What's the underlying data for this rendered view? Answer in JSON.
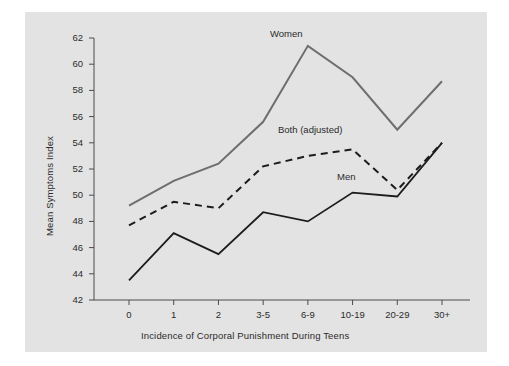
{
  "figure": {
    "background_color": "#ffffff",
    "panel_color": "#e3e3e3",
    "axis_color": "#4a4a4a",
    "text_color": "#2b2b2b"
  },
  "chart_data": {
    "type": "line",
    "title": "",
    "xlabel": "Incidence of Corporal Punishment During Teens",
    "ylabel": "Mean Symptoms Index",
    "categories": [
      "0",
      "1",
      "2",
      "3-5",
      "6-9",
      "10-19",
      "20-29",
      "30+"
    ],
    "ylim": [
      42,
      62
    ],
    "yticks": [
      42,
      44,
      46,
      48,
      50,
      52,
      54,
      56,
      58,
      60,
      62
    ],
    "ytick_labels": [
      "42",
      "44",
      "46",
      "48",
      "50",
      "52",
      "54",
      "56",
      "58",
      "60",
      "62"
    ],
    "grid": false,
    "legend": "inline-annotations",
    "series": [
      {
        "name": "Women",
        "style": "solid",
        "color": "#6e6e6e",
        "width": 2.0,
        "label_text": "Women",
        "values": [
          49.2,
          51.1,
          52.4,
          55.6,
          61.4,
          59.0,
          55.0,
          58.7
        ]
      },
      {
        "name": "Both (adjusted)",
        "style": "dashed",
        "color": "#1c1c1c",
        "width": 2.0,
        "label_text": "Both (adjusted)",
        "values": [
          47.7,
          49.5,
          49.0,
          52.2,
          53.0,
          53.5,
          50.4,
          54.0
        ]
      },
      {
        "name": "Men",
        "style": "solid",
        "color": "#1c1c1c",
        "width": 1.8,
        "label_text": "Men",
        "values": [
          43.5,
          47.1,
          45.5,
          48.7,
          48.0,
          50.2,
          49.9,
          54.0
        ]
      }
    ],
    "annotations": [
      {
        "name": "women-label",
        "text": "Women",
        "x_px": 270,
        "y_px": 28
      },
      {
        "name": "both-adjusted-label",
        "text": "Both (adjusted)",
        "x_px": 278,
        "y_px": 124
      },
      {
        "name": "men-label",
        "text": "Men",
        "x_px": 337,
        "y_px": 171
      }
    ]
  }
}
